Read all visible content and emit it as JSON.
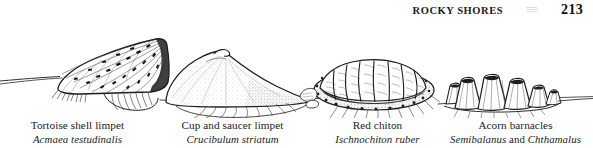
{
  "header": {
    "title": "ROCKY SHORES",
    "page_number": "213",
    "separator_icon": "scan-smudge-icon"
  },
  "figure": {
    "name": "rocky-shore-intertidal-animals-plate",
    "medium": "pen-and-ink line drawing",
    "substrate": "rock surface ground line running full width",
    "specimens": [
      {
        "id": "tortoise-shell-limpet",
        "common_name": "Tortoise shell limpet",
        "scientific_name": "Acmaea testudinalis",
        "form": "low conical shell, radiating ribs with dark tessellated blotches, apex to the right"
      },
      {
        "id": "cup-and-saucer-limpet",
        "common_name": "Cup and saucer limpet",
        "scientific_name": "Crucibulum striatum",
        "form": "smooth stippled dome with small hooked apex"
      },
      {
        "id": "red-chiton",
        "common_name": "Red chiton",
        "scientific_name": "Ischnochiton ruber",
        "form": "oval body of eight overlapping valves bordered by a granular girdle"
      },
      {
        "id": "acorn-barnacles",
        "common_name": "Acorn barnacles",
        "scientific_name_part1": "Semibalanus",
        "scientific_conjunction": "and",
        "scientific_name_part2": "Chthamalus",
        "form": "cluster of six ridged volcano-shaped cones with dark apertures"
      }
    ]
  },
  "colors": {
    "page_background": "#ffffff",
    "ink": "#1a1a1a",
    "ink_mid": "#4a4a4a",
    "ink_light": "#8a8a8a"
  }
}
